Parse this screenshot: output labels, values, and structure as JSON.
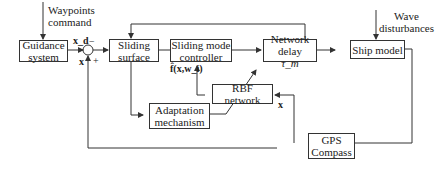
{
  "inputs": {
    "waypoints": [
      "Waypoints",
      "command"
    ],
    "wave": [
      "Wave",
      "disturbances"
    ]
  },
  "blocks": {
    "guidance": [
      "Guidance",
      "system"
    ],
    "sliding_surface": [
      "Sliding",
      "surface"
    ],
    "smc": [
      "Sliding mode",
      "controller"
    ],
    "network_delay": [
      "Network delay",
      "τ_m"
    ],
    "ship_model": [
      "Ship model"
    ],
    "rbf": [
      "RBF network"
    ],
    "adaptation": [
      "Adaptation",
      "mechanism"
    ],
    "gps": [
      "GPS",
      "Compass"
    ]
  },
  "signals": {
    "xd": "x_d",
    "x_sum": "x",
    "f_hat": "f̂(x,w_i)",
    "x_rbf": "x",
    "minus": "−",
    "plus": "+"
  },
  "colors": {
    "line": "#333333",
    "background": "#ffffff"
  }
}
